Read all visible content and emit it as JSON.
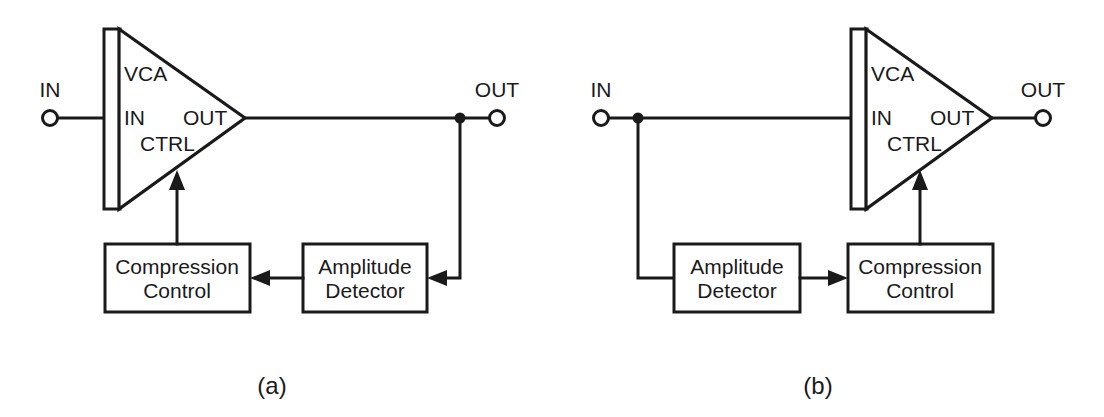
{
  "figure": {
    "background_color": "#ffffff",
    "line_color": "#1a1a1a"
  },
  "panels": [
    {
      "id": "panel-a",
      "caption": "(a)",
      "topology": "feedback",
      "input_terminal": {
        "label": "IN"
      },
      "output_terminal": {
        "label": "OUT"
      },
      "vca": {
        "title": "VCA",
        "pins": {
          "input": "IN",
          "output": "OUT",
          "control": "CTRL"
        }
      },
      "blocks": [
        {
          "id": "compression-control-a",
          "line1": "Compression",
          "line2": "Control"
        },
        {
          "id": "amplitude-detector-a",
          "line1": "Amplitude",
          "line2": "Detector"
        }
      ],
      "signal_path": [
        "IN terminal to VCA IN",
        "VCA OUT to OUT terminal",
        "OUT tap down to Amplitude Detector",
        "Amplitude Detector to Compression Control",
        "Compression Control up to VCA CTRL"
      ]
    },
    {
      "id": "panel-b",
      "caption": "(b)",
      "topology": "feedforward",
      "input_terminal": {
        "label": "IN"
      },
      "output_terminal": {
        "label": "OUT"
      },
      "vca": {
        "title": "VCA",
        "pins": {
          "input": "IN",
          "output": "OUT",
          "control": "CTRL"
        }
      },
      "blocks": [
        {
          "id": "amplitude-detector-b",
          "line1": "Amplitude",
          "line2": "Detector"
        },
        {
          "id": "compression-control-b",
          "line1": "Compression",
          "line2": "Control"
        }
      ],
      "signal_path": [
        "IN terminal to VCA IN",
        "IN tap down to Amplitude Detector",
        "Amplitude Detector to Compression Control",
        "Compression Control up to VCA CTRL",
        "VCA OUT to OUT terminal"
      ]
    }
  ]
}
